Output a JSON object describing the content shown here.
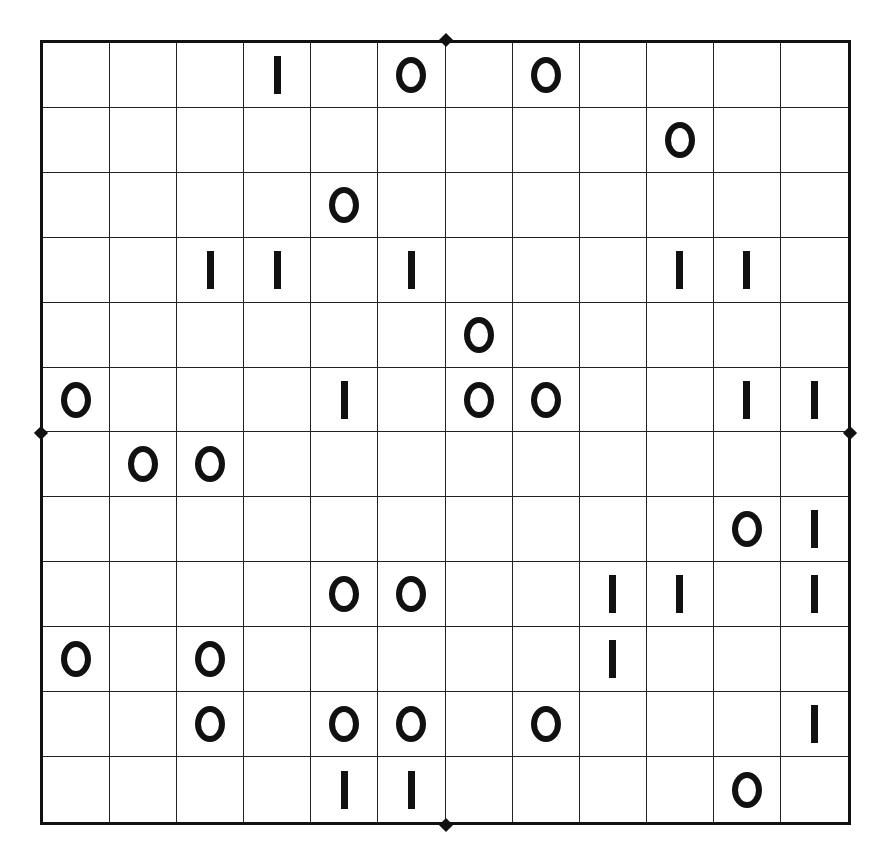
{
  "puzzle": {
    "type": "binary-grid",
    "rows": 12,
    "cols": 12,
    "symbols": {
      "zero": "O",
      "one": "I"
    },
    "grid": [
      [
        "",
        "",
        "",
        "I",
        "",
        "O",
        "",
        "O",
        "",
        "",
        "",
        ""
      ],
      [
        "",
        "",
        "",
        "",
        "",
        "",
        "",
        "",
        "",
        "O",
        "",
        ""
      ],
      [
        "",
        "",
        "",
        "",
        "O",
        "",
        "",
        "",
        "",
        "",
        "",
        ""
      ],
      [
        "",
        "",
        "I",
        "I",
        "",
        "I",
        "",
        "",
        "",
        "I",
        "I",
        ""
      ],
      [
        "",
        "",
        "",
        "",
        "",
        "",
        "O",
        "",
        "",
        "",
        "",
        ""
      ],
      [
        "O",
        "",
        "",
        "",
        "I",
        "",
        "O",
        "O",
        "",
        "",
        "I",
        "I"
      ],
      [
        "",
        "O",
        "O",
        "",
        "",
        "",
        "",
        "",
        "",
        "",
        "",
        ""
      ],
      [
        "",
        "",
        "",
        "",
        "",
        "",
        "",
        "",
        "",
        "",
        "O",
        "I"
      ],
      [
        "",
        "",
        "",
        "",
        "O",
        "O",
        "",
        "",
        "I",
        "I",
        "",
        "I"
      ],
      [
        "O",
        "",
        "O",
        "",
        "",
        "",
        "",
        "",
        "I",
        "",
        "",
        ""
      ],
      [
        "",
        "",
        "O",
        "",
        "O",
        "O",
        "",
        "O",
        "",
        "",
        "",
        "I"
      ],
      [
        "",
        "",
        "",
        "",
        "I",
        "I",
        "",
        "",
        "",
        "",
        "O",
        ""
      ]
    ],
    "colors": {
      "line": "#222222",
      "symbol": "#111111",
      "background": "#ffffff"
    }
  }
}
